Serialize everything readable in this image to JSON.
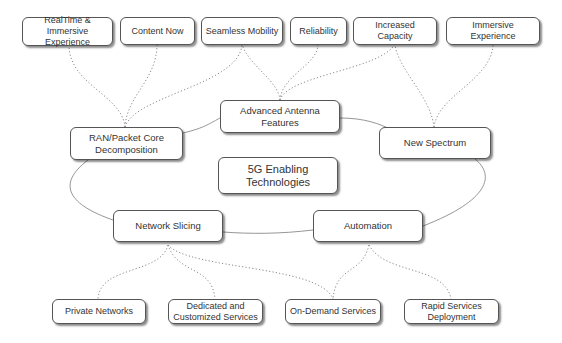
{
  "diagram": {
    "title": "5G Enabling Technologies",
    "center": {
      "label_line1": "5G Enabling",
      "label_line2": "Technologies"
    },
    "technologies": [
      {
        "id": "advanced-antenna",
        "line1": "Advanced Antenna",
        "line2": "Features"
      },
      {
        "id": "ran-packet-core",
        "line1": "RAN/Packet Core",
        "line2": "Decomposition"
      },
      {
        "id": "new-spectrum",
        "line1": "New Spectrum",
        "line2": ""
      },
      {
        "id": "network-slicing",
        "line1": "Network Slicing",
        "line2": ""
      },
      {
        "id": "automation",
        "line1": "Automation",
        "line2": ""
      }
    ],
    "benefits_top": [
      {
        "id": "realtime-immersive",
        "line1": "RealTime & Immersive",
        "line2": "Experience"
      },
      {
        "id": "content-now",
        "line1": "Content Now",
        "line2": ""
      },
      {
        "id": "seamless-mobility",
        "line1": "Seamless Mobility",
        "line2": ""
      },
      {
        "id": "reliability",
        "line1": "Reliability",
        "line2": ""
      },
      {
        "id": "increased-capacity",
        "line1": "Increased Capacity",
        "line2": ""
      },
      {
        "id": "immersive-experience",
        "line1": "Immersive Experience",
        "line2": ""
      }
    ],
    "services_bottom": [
      {
        "id": "private-networks",
        "line1": "Private Networks",
        "line2": ""
      },
      {
        "id": "dedicated-customized",
        "line1": "Dedicated and",
        "line2": "Customized Services"
      },
      {
        "id": "on-demand",
        "line1": "On-Demand Services",
        "line2": ""
      },
      {
        "id": "rapid-deployment",
        "line1": "Rapid Services",
        "line2": "Deployment"
      }
    ],
    "connections": [
      {
        "from": "RAN/Packet Core Decomposition",
        "to": "RealTime & Immersive Experience",
        "style": "dotted"
      },
      {
        "from": "RAN/Packet Core Decomposition",
        "to": "Content Now",
        "style": "dotted"
      },
      {
        "from": "RAN/Packet Core Decomposition",
        "to": "Seamless Mobility",
        "style": "dotted"
      },
      {
        "from": "Advanced Antenna Features",
        "to": "Seamless Mobility",
        "style": "dotted"
      },
      {
        "from": "Advanced Antenna Features",
        "to": "Reliability",
        "style": "dotted"
      },
      {
        "from": "Advanced Antenna Features",
        "to": "Increased Capacity",
        "style": "dotted"
      },
      {
        "from": "New Spectrum",
        "to": "Increased Capacity",
        "style": "dotted"
      },
      {
        "from": "New Spectrum",
        "to": "Immersive Experience",
        "style": "dotted"
      },
      {
        "from": "Network Slicing",
        "to": "Private Networks",
        "style": "dotted"
      },
      {
        "from": "Network Slicing",
        "to": "Dedicated and Customized Services",
        "style": "dotted"
      },
      {
        "from": "Network Slicing",
        "to": "On-Demand Services",
        "style": "dotted"
      },
      {
        "from": "Automation",
        "to": "On-Demand Services",
        "style": "dotted"
      },
      {
        "from": "Automation",
        "to": "Rapid Services Deployment",
        "style": "dotted"
      },
      {
        "from": "RAN/Packet Core Decomposition",
        "to": "Advanced Antenna Features",
        "style": "solid-ring"
      },
      {
        "from": "Advanced Antenna Features",
        "to": "New Spectrum",
        "style": "solid-ring"
      },
      {
        "from": "New Spectrum",
        "to": "Automation",
        "style": "solid-ring"
      },
      {
        "from": "Automation",
        "to": "Network Slicing",
        "style": "solid-ring"
      },
      {
        "from": "Network Slicing",
        "to": "RAN/Packet Core Decomposition",
        "style": "solid-ring"
      }
    ],
    "colors": {
      "border": "#555555",
      "text": "#333333",
      "line": "#888888",
      "background": "#ffffff"
    }
  }
}
